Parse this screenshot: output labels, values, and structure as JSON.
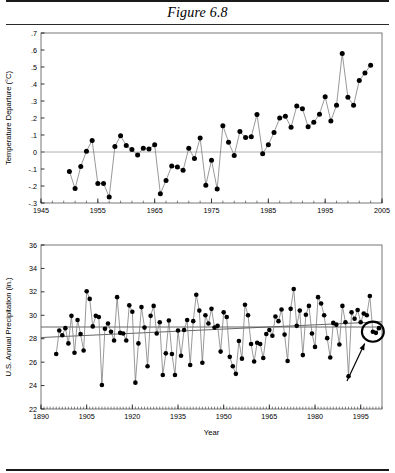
{
  "figure": {
    "title": "Figure 6.8",
    "xlabel": "Year"
  },
  "chart_data": [
    {
      "id": "temperature",
      "type": "line",
      "title": "",
      "xlabel": "",
      "ylabel": "Temperature Departure (°C)",
      "xlim": [
        1945,
        2005
      ],
      "ylim": [
        -0.3,
        0.7
      ],
      "xticks": [
        1945,
        1955,
        1965,
        1975,
        1985,
        1995,
        2005
      ],
      "xticklabels": [
        "1945",
        "1955",
        "1965",
        "1975",
        "1985",
        "1995",
        "2005"
      ],
      "yticks": [
        -0.3,
        -0.2,
        -0.1,
        0.0,
        0.1,
        0.2,
        0.3,
        0.4,
        0.5,
        0.6,
        0.7
      ],
      "yticklabels": [
        "-.3",
        "-.2",
        "-.1",
        "0",
        ".1",
        ".2",
        ".3",
        ".4",
        ".5",
        ".6",
        ".7"
      ],
      "grid": false,
      "legend": "none",
      "zero_reference": 0.0,
      "markers": "filled-circle",
      "x": [
        1950,
        1951,
        1952,
        1953,
        1954,
        1955,
        1956,
        1957,
        1958,
        1959,
        1960,
        1961,
        1962,
        1963,
        1964,
        1965,
        1966,
        1967,
        1968,
        1969,
        1970,
        1971,
        1972,
        1973,
        1974,
        1975,
        1976,
        1977,
        1978,
        1979,
        1980,
        1981,
        1982,
        1983,
        1984,
        1985,
        1986,
        1987,
        1988,
        1989,
        1990,
        1991,
        1992,
        1993,
        1994,
        1995,
        1996,
        1997,
        1998,
        1999,
        2000,
        2001,
        2002,
        2003
      ],
      "values": [
        -0.115,
        -0.215,
        -0.085,
        0.005,
        0.068,
        -0.185,
        -0.185,
        -0.265,
        0.033,
        0.095,
        0.038,
        0.015,
        -0.018,
        0.022,
        0.018,
        0.042,
        -0.245,
        -0.168,
        -0.082,
        -0.088,
        -0.108,
        0.022,
        -0.038,
        0.082,
        -0.195,
        -0.048,
        -0.218,
        0.155,
        0.058,
        -0.02,
        0.12,
        0.085,
        0.09,
        0.22,
        -0.01,
        0.043,
        0.115,
        0.2,
        0.21,
        0.145,
        0.27,
        0.255,
        0.148,
        0.175,
        0.222,
        0.325,
        0.183,
        0.275,
        0.58,
        0.322,
        0.275,
        0.42,
        0.465,
        0.51
      ]
    },
    {
      "id": "precipitation",
      "type": "line",
      "title": "",
      "xlabel": "Year",
      "ylabel": "U.S. Annual Precipitation (in.)",
      "xlim": [
        1890,
        2002
      ],
      "ylim": [
        22,
        36
      ],
      "xticks": [
        1890,
        1905,
        1920,
        1935,
        1950,
        1965,
        1980,
        1995
      ],
      "xticklabels": [
        "1890",
        "1905",
        "1920",
        "1935",
        "1950",
        "1965",
        "1980",
        "1995"
      ],
      "yticks": [
        22,
        24,
        26,
        28,
        30,
        32,
        34,
        36
      ],
      "yticklabels": [
        "22",
        "24",
        "26",
        "28",
        "30",
        "32",
        "34",
        "36"
      ],
      "grid": false,
      "legend": "none",
      "markers": "filled-circle",
      "reference_line": {
        "value": 29.0,
        "label": ""
      },
      "trend_line": {
        "x": [
          1890,
          2002
        ],
        "y": [
          28.1,
          29.45
        ],
        "label": ""
      },
      "annotation": {
        "type": "circle-with-arrow",
        "circle_center_year": 1999.0,
        "circle_center_value": 28.6,
        "circle_radius_years": 3.6,
        "arrow_from_year": 1990.5,
        "arrow_from_value": 24.4,
        "arrow_to_year": 1996.3,
        "arrow_to_value": 27.6
      },
      "x": [
        1895,
        1896,
        1897,
        1898,
        1899,
        1900,
        1901,
        1902,
        1903,
        1904,
        1905,
        1906,
        1907,
        1908,
        1909,
        1910,
        1911,
        1912,
        1913,
        1914,
        1915,
        1916,
        1917,
        1918,
        1919,
        1920,
        1921,
        1922,
        1923,
        1924,
        1925,
        1926,
        1927,
        1928,
        1929,
        1930,
        1931,
        1932,
        1933,
        1934,
        1935,
        1936,
        1937,
        1938,
        1939,
        1940,
        1941,
        1942,
        1943,
        1944,
        1945,
        1946,
        1947,
        1948,
        1949,
        1950,
        1951,
        1952,
        1953,
        1954,
        1955,
        1956,
        1957,
        1958,
        1959,
        1960,
        1961,
        1962,
        1963,
        1964,
        1965,
        1966,
        1967,
        1968,
        1969,
        1970,
        1971,
        1972,
        1973,
        1974,
        1975,
        1976,
        1977,
        1978,
        1979,
        1980,
        1981,
        1982,
        1983,
        1984,
        1985,
        1986,
        1987,
        1988,
        1989,
        1990,
        1991,
        1992,
        1993,
        1994,
        1995,
        1996,
        1997,
        1998,
        1999,
        2000,
        2001
      ],
      "values": [
        26.7,
        28.7,
        28.3,
        28.9,
        27.6,
        29.95,
        26.8,
        29.6,
        28.4,
        27.0,
        32.05,
        31.4,
        29.05,
        29.95,
        29.85,
        24.05,
        28.85,
        29.3,
        28.6,
        27.85,
        31.55,
        28.5,
        28.45,
        27.85,
        30.85,
        30.3,
        24.25,
        27.6,
        30.7,
        28.95,
        25.65,
        29.95,
        30.8,
        28.45,
        29.4,
        24.9,
        26.75,
        29.55,
        26.7,
        24.9,
        28.7,
        26.55,
        28.75,
        29.6,
        25.75,
        29.5,
        31.75,
        30.4,
        25.95,
        30.0,
        29.3,
        30.55,
        28.95,
        29.1,
        26.9,
        30.25,
        29.85,
        26.45,
        25.65,
        25.0,
        27.8,
        26.3,
        30.9,
        30.0,
        27.55,
        26.05,
        27.65,
        27.55,
        26.35,
        28.4,
        28.75,
        28.25,
        29.9,
        29.5,
        30.5,
        28.35,
        26.1,
        30.55,
        32.25,
        29.1,
        30.4,
        26.6,
        30.05,
        30.8,
        28.45,
        27.3,
        31.55,
        31.0,
        30.0,
        28.05,
        26.4,
        29.35,
        29.2,
        27.5,
        30.8,
        29.4,
        24.8,
        30.25,
        29.7,
        30.45,
        29.4,
        30.15,
        30.0,
        31.65,
        28.6,
        28.5,
        28.9
      ]
    }
  ]
}
